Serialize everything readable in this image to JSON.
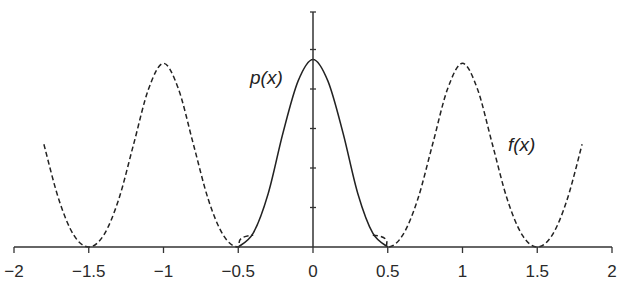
{
  "chart_data": {
    "type": "line",
    "title": "",
    "xlabel": "",
    "ylabel": "",
    "xlim": [
      -2,
      2
    ],
    "ylim": [
      0,
      6
    ],
    "grid": false,
    "legend": "none",
    "x_ticks": [
      -2,
      -1.5,
      -1,
      -0.5,
      0,
      0.5,
      1,
      1.5,
      2
    ],
    "x_tick_labels": [
      "−2",
      "−1.5",
      "−1",
      "−0.5",
      "0",
      "0.5",
      "1",
      "1.5",
      "2"
    ],
    "y_ticks": [
      1,
      2,
      3,
      4,
      5,
      6
    ],
    "y_tick_labels": [],
    "series": [
      {
        "name": "p(x)",
        "label": "p(x)",
        "style": "solid",
        "color": "#222222",
        "description": "Gaussian-like bump centered at 0, support about [-0.5, 0.5]",
        "x": [
          -0.5,
          -0.4,
          -0.3,
          -0.2,
          -0.1,
          0,
          0.1,
          0.2,
          0.3,
          0.4,
          0.5
        ],
        "y": [
          0.0,
          0.35,
          1.35,
          2.9,
          4.2,
          4.75,
          4.2,
          2.9,
          1.35,
          0.35,
          0.0
        ]
      },
      {
        "name": "f(x)",
        "label": "f(x)",
        "style": "dashed",
        "color": "#222222",
        "description": "Periodic function with peaks at -1 and 1, zeros near -1.5, -0.5, 0.5, 1.5; drawn from -1.8 to 1.8",
        "x": [
          -1.8,
          -1.7,
          -1.6,
          -1.5,
          -1.4,
          -1.3,
          -1.2,
          -1.1,
          -1.0,
          -0.9,
          -0.8,
          -0.7,
          -0.6,
          -0.5,
          -0.4,
          0.4,
          0.5,
          0.6,
          0.7,
          0.8,
          0.9,
          1.0,
          1.1,
          1.2,
          1.3,
          1.4,
          1.5,
          1.6,
          1.7,
          1.8
        ],
        "y": [
          2.6,
          1.2,
          0.3,
          0.0,
          0.3,
          1.2,
          2.6,
          4.0,
          4.65,
          4.0,
          2.6,
          1.2,
          0.3,
          0.0,
          0.3,
          0.3,
          0.0,
          0.3,
          1.2,
          2.6,
          4.0,
          4.65,
          4.0,
          2.6,
          1.2,
          0.3,
          0.0,
          0.3,
          1.2,
          2.6
        ]
      }
    ],
    "annotations": [
      {
        "text": "p(x)",
        "near_x": -0.2,
        "near_y": 4.5
      },
      {
        "text": "f(x)",
        "near_x": 1.4,
        "near_y": 2.6
      }
    ]
  }
}
